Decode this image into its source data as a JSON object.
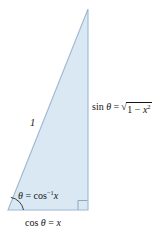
{
  "figure": {
    "background_color": "#ffffff",
    "triangle": {
      "fill_color": "#dae8f4",
      "stroke_color": "#9cb8d3",
      "vertices": {
        "apex": [
          88,
          9
        ],
        "bottom_right": [
          88,
          210
        ],
        "bottom_left": [
          8,
          210
        ]
      }
    },
    "right_angle_marker": {
      "name": "right-angle-square",
      "color": "#8aa7c4"
    },
    "angle_arc": {
      "name": "theta-angle-arc",
      "color": "#141414"
    }
  },
  "labels": {
    "hypotenuse": "1",
    "angle": {
      "theta": "θ",
      "equals": "=",
      "fn": "cos",
      "exponent": "−1",
      "arg": "x"
    },
    "adjacent": {
      "fn": "cos",
      "theta": "θ",
      "equals": "=",
      "value": "x"
    },
    "opposite": {
      "fn": "sin",
      "theta": "θ",
      "equals": "=",
      "radical_sign": "√",
      "radicand_one": "1",
      "minus": "−",
      "radicand_var": "x",
      "radicand_exp": "2"
    }
  }
}
